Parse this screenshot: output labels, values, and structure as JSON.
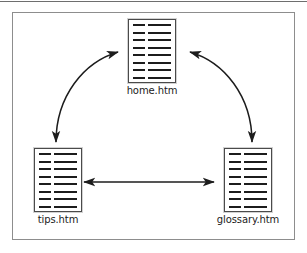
{
  "figure": {
    "type": "site-navigation-diagram",
    "frame_border_color": "#8d8d8d",
    "background_color": "#ffffff",
    "page_rule_color": "#6e6e6e"
  },
  "nodes": [
    {
      "id": "home",
      "label": "home.htm",
      "icon": "document-page-icon",
      "line_rows": 8,
      "border_color": "#4a4a4a",
      "rule_color": "#1c1c1c"
    },
    {
      "id": "tips",
      "label": "tips.htm",
      "icon": "document-page-icon",
      "line_rows": 8,
      "border_color": "#4a4a4a",
      "rule_color": "#1c1c1c"
    },
    {
      "id": "glossary",
      "label": "glossary.htm",
      "icon": "document-page-icon",
      "line_rows": 8,
      "border_color": "#4a4a4a",
      "rule_color": "#1c1c1c"
    }
  ],
  "connectors": [
    {
      "id": "tips-home",
      "from": "tips",
      "to": "home",
      "style": "curved",
      "arrowheads": "both",
      "color": "#1c1c1c"
    },
    {
      "id": "home-glossary",
      "from": "home",
      "to": "glossary",
      "style": "curved",
      "arrowheads": "both",
      "color": "#1c1c1c"
    },
    {
      "id": "tips-glossary",
      "from": "tips",
      "to": "glossary",
      "style": "straight",
      "arrowheads": "both",
      "color": "#1c1c1c"
    }
  ]
}
